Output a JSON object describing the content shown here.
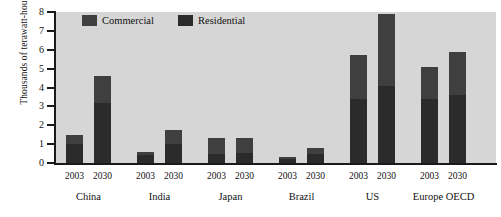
{
  "chart_data": {
    "type": "bar",
    "subtype": "stacked-bar-grouped",
    "title": "",
    "xlabel": "",
    "ylabel": "Thousands of terawatt-hours",
    "ylim": [
      0,
      8
    ],
    "yticks": [
      0,
      1,
      2,
      3,
      4,
      5,
      6,
      7,
      8
    ],
    "grid": false,
    "legend_position": "top-inside-left",
    "categories": [
      "China 2003",
      "China 2030",
      "India 2003",
      "India 2030",
      "Japan 2003",
      "Japan 2030",
      "Brazil 2003",
      "Brazil 2030",
      "US 2003",
      "US 2030",
      "Europe OECD 2003",
      "Europe OECD 2030"
    ],
    "groups": [
      {
        "name": "China",
        "years": [
          "2003",
          "2030"
        ]
      },
      {
        "name": "India",
        "years": [
          "2003",
          "2030"
        ]
      },
      {
        "name": "Japan",
        "years": [
          "2003",
          "2030"
        ]
      },
      {
        "name": "Brazil",
        "years": [
          "2003",
          "2030"
        ]
      },
      {
        "name": "US",
        "years": [
          "2003",
          "2030"
        ]
      },
      {
        "name": "Europe OECD",
        "years": [
          "2003",
          "2030"
        ]
      }
    ],
    "series": [
      {
        "name": "Residential",
        "color": "#2b2b2b",
        "values": [
          1.0,
          3.2,
          0.45,
          1.0,
          0.5,
          0.55,
          0.2,
          0.5,
          3.4,
          4.1,
          3.4,
          3.6
        ]
      },
      {
        "name": "Commercial",
        "color": "#3f3f3f",
        "values": [
          0.5,
          1.4,
          0.15,
          0.75,
          0.85,
          0.8,
          0.1,
          0.3,
          2.3,
          3.8,
          1.7,
          2.3
        ]
      }
    ],
    "totals": [
      1.5,
      4.6,
      0.6,
      1.75,
      1.35,
      1.35,
      0.3,
      0.8,
      5.7,
      7.9,
      5.1,
      5.9
    ]
  },
  "legend": {
    "items": [
      {
        "label": "Commercial",
        "color": "#3f3f3f"
      },
      {
        "label": "Residential",
        "color": "#2b2b2b"
      }
    ]
  },
  "axes": {
    "y_title": "Thousands of terawatt-hours",
    "y_tick_labels": [
      "8",
      "7",
      "6",
      "5",
      "4",
      "3",
      "2",
      "1",
      "0"
    ]
  },
  "colors": {
    "plot_background": "#d6d6d6",
    "page_background": "#ffffff",
    "axis": "#1a1a1a",
    "commercial": "#3f3f3f",
    "residential": "#2b2b2b"
  }
}
